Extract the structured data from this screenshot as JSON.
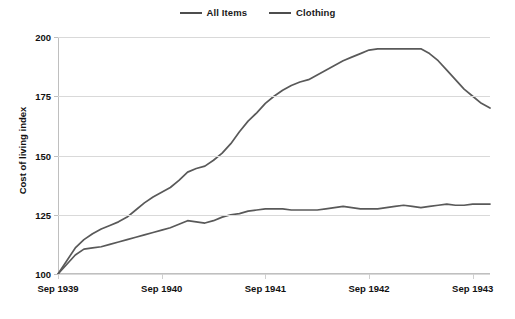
{
  "chart_data": {
    "type": "line",
    "title": "",
    "xlabel": "",
    "ylabel": "Cost of living index",
    "ylim": [
      100,
      200
    ],
    "yticks": [
      100,
      125,
      150,
      175,
      200
    ],
    "ytick_labels": [
      "100",
      "125",
      "150",
      "175",
      "200"
    ],
    "xtick_labels": [
      "Sep 1939",
      "Sep 1940",
      "Sep 1941",
      "Sep 1942",
      "Sep 1943"
    ],
    "xtick_positions_months": [
      0,
      12,
      24,
      36,
      48
    ],
    "xlim_months": [
      0,
      50
    ],
    "grid": "horizontal",
    "legend_position": "top-center",
    "series": [
      {
        "name": "All Items",
        "color": "#595959",
        "x": [
          0,
          1,
          2,
          3,
          4,
          5,
          6,
          7,
          8,
          9,
          10,
          11,
          12,
          13,
          14,
          15,
          16,
          17,
          18,
          19,
          20,
          21,
          22,
          23,
          24,
          25,
          26,
          27,
          28,
          29,
          30,
          31,
          32,
          33,
          34,
          35,
          36,
          37,
          38,
          39,
          40,
          41,
          42,
          43,
          44,
          45,
          46,
          47,
          48,
          49,
          50
        ],
        "values": [
          100,
          105.5,
          111,
          114.5,
          117,
          119,
          120.5,
          122,
          124,
          127,
          130,
          132.5,
          134.5,
          136.5,
          139.5,
          143,
          144.5,
          145.5,
          148,
          151,
          155,
          160,
          164.5,
          168,
          172,
          175,
          177.5,
          179.5,
          181,
          182,
          184,
          186,
          188,
          190,
          191.5,
          193,
          194.5,
          195,
          195,
          195,
          195,
          195,
          195,
          193,
          190,
          186,
          182,
          178,
          175,
          172,
          170
        ]
      },
      {
        "name": "Clothing",
        "color": "#595959",
        "x": [
          0,
          1,
          2,
          3,
          4,
          5,
          6,
          7,
          8,
          9,
          10,
          11,
          12,
          13,
          14,
          15,
          16,
          17,
          18,
          19,
          20,
          21,
          22,
          23,
          24,
          25,
          26,
          27,
          28,
          29,
          30,
          31,
          32,
          33,
          34,
          35,
          36,
          37,
          38,
          39,
          40,
          41,
          42,
          43,
          44,
          45,
          46,
          47,
          48,
          49,
          50
        ],
        "values": [
          100,
          104,
          108,
          110.5,
          111,
          111.5,
          112.5,
          113.5,
          114.5,
          115.5,
          116.5,
          117.5,
          118.5,
          119.5,
          121,
          122.5,
          122,
          121.5,
          122.5,
          124,
          125,
          125.5,
          126.5,
          127,
          127.5,
          127.5,
          127.5,
          127,
          127,
          127,
          127,
          127.5,
          128,
          128.5,
          128,
          127.5,
          127.5,
          127.5,
          128,
          128.5,
          129,
          128.5,
          128,
          128.5,
          129,
          129.5,
          129,
          129,
          129.5,
          129.5,
          129.5
        ]
      }
    ]
  },
  "legend": {
    "items": [
      {
        "label": "All Items",
        "swatch": "line-swatch"
      },
      {
        "label": "Clothing",
        "swatch": "line-swatch"
      }
    ]
  },
  "axes": {
    "y_title": "Cost of living index"
  }
}
